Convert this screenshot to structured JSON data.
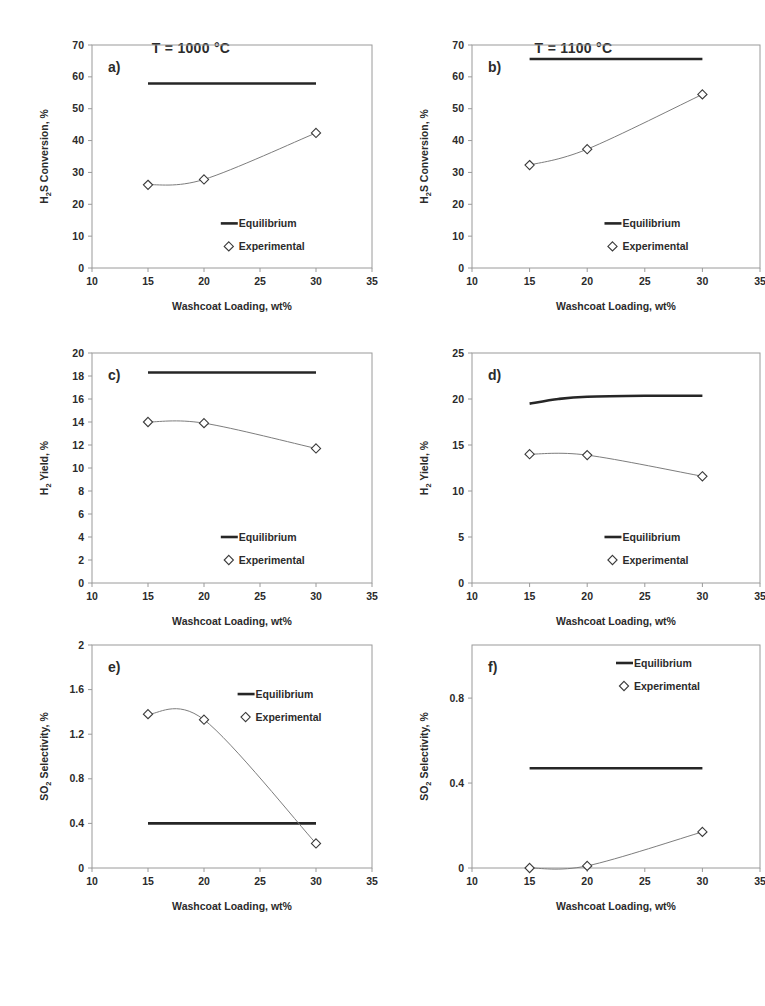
{
  "figure": {
    "column_titles": [
      "T = 1000 °C",
      "T = 1100 °C"
    ],
    "legend": {
      "equilibrium": "Equilibrium",
      "experimental": "Experimental"
    },
    "xlabel": "Washcoat Loading, wt%",
    "colors": {
      "equilibrium_line": "#262626",
      "experimental_line": "#7d7d7d",
      "marker_fill": "#ffffff",
      "marker_stroke": "#3a3a3a",
      "axis": "#9a9a9a",
      "text": "#2b2b2b",
      "background": "#ffffff"
    }
  },
  "chart_data": [
    {
      "id": "a",
      "panel_label": "a)",
      "type": "line",
      "title": "T = 1000 °C",
      "xlabel": "Washcoat Loading, wt%",
      "ylabel": "H₂S Conversion, %",
      "ylabel_parts": {
        "pre": "H",
        "sub": "2",
        "post": "S Conversion, %"
      },
      "xlim": [
        10,
        35
      ],
      "ylim": [
        0,
        70
      ],
      "xticks": [
        10,
        15,
        20,
        25,
        30,
        35
      ],
      "yticks": [
        0,
        10,
        20,
        30,
        40,
        50,
        60,
        70
      ],
      "grid": false,
      "legend_position": "inside-bottom-right",
      "series": [
        {
          "name": "Equilibrium",
          "style": "solid-thick",
          "x": [
            15,
            20,
            25,
            30
          ],
          "values": [
            57.9,
            57.9,
            57.9,
            57.9
          ]
        },
        {
          "name": "Experimental",
          "style": "line-marker-diamond",
          "x": [
            15,
            20,
            30
          ],
          "values": [
            26.1,
            27.8,
            42.4
          ]
        }
      ]
    },
    {
      "id": "b",
      "panel_label": "b)",
      "type": "line",
      "title": "T = 1100 °C",
      "xlabel": "Washcoat Loading, wt%",
      "ylabel": "H₂S Conversion, %",
      "ylabel_parts": {
        "pre": "H",
        "sub": "2",
        "post": "S Conversion, %"
      },
      "xlim": [
        10,
        35
      ],
      "ylim": [
        0,
        70
      ],
      "xticks": [
        10,
        15,
        20,
        25,
        30,
        35
      ],
      "yticks": [
        0,
        10,
        20,
        30,
        40,
        50,
        60,
        70
      ],
      "grid": false,
      "legend_position": "inside-bottom-right",
      "series": [
        {
          "name": "Equilibrium",
          "style": "solid-thick",
          "x": [
            15,
            20,
            25,
            30
          ],
          "values": [
            65.6,
            65.6,
            65.6,
            65.6
          ]
        },
        {
          "name": "Experimental",
          "style": "line-marker-diamond",
          "x": [
            15,
            20,
            30
          ],
          "values": [
            32.3,
            37.3,
            54.5
          ]
        }
      ]
    },
    {
      "id": "c",
      "panel_label": "c)",
      "type": "line",
      "title": "T = 1000 °C",
      "xlabel": "Washcoat Loading, wt%",
      "ylabel": "H₂ Yield, %",
      "ylabel_parts": {
        "pre": "H",
        "sub": "2",
        "post": " Yield, %"
      },
      "xlim": [
        10,
        35
      ],
      "ylim": [
        0,
        20
      ],
      "xticks": [
        10,
        15,
        20,
        25,
        30,
        35
      ],
      "yticks": [
        0,
        2,
        4,
        6,
        8,
        10,
        12,
        14,
        16,
        18,
        20
      ],
      "grid": false,
      "legend_position": "inside-bottom-right",
      "series": [
        {
          "name": "Equilibrium",
          "style": "solid-thick",
          "x": [
            15,
            20,
            25,
            30
          ],
          "values": [
            18.3,
            18.3,
            18.3,
            18.3
          ]
        },
        {
          "name": "Experimental",
          "style": "line-marker-diamond",
          "x": [
            15,
            20,
            30
          ],
          "values": [
            14.0,
            13.9,
            11.7
          ]
        }
      ]
    },
    {
      "id": "d",
      "panel_label": "d)",
      "type": "line",
      "title": "T = 1100 °C",
      "xlabel": "Washcoat Loading, wt%",
      "ylabel": "H₂ Yield, %",
      "ylabel_parts": {
        "pre": "H",
        "sub": "2",
        "post": " Yield, %"
      },
      "xlim": [
        10,
        35
      ],
      "ylim": [
        0,
        25
      ],
      "xticks": [
        10,
        15,
        20,
        25,
        30,
        35
      ],
      "yticks": [
        0,
        5,
        10,
        15,
        20,
        25
      ],
      "grid": false,
      "legend_position": "inside-bottom-right",
      "series": [
        {
          "name": "Equilibrium",
          "style": "solid-thick",
          "x": [
            15,
            17.5,
            20,
            25,
            30
          ],
          "values": [
            19.5,
            20.0,
            20.25,
            20.35,
            20.35
          ]
        },
        {
          "name": "Experimental",
          "style": "line-marker-diamond",
          "x": [
            15,
            20,
            30
          ],
          "values": [
            14.0,
            13.9,
            11.6
          ]
        }
      ]
    },
    {
      "id": "e",
      "panel_label": "e)",
      "type": "line",
      "title": "T = 1000 °C",
      "xlabel": "Washcoat Loading, wt%",
      "ylabel": "SO₂ Selectivity, %",
      "ylabel_parts": {
        "pre": "SO",
        "sub": "2",
        "post": " Selectivity, %"
      },
      "xlim": [
        10,
        35
      ],
      "ylim": [
        0,
        2
      ],
      "xticks": [
        10,
        15,
        20,
        25,
        30,
        35
      ],
      "yticks": [
        0,
        0.4,
        0.8,
        1.2,
        1.6,
        2
      ],
      "ytick_labels": [
        "0",
        "0.4",
        "0.8",
        "1.2",
        "1.6",
        "2"
      ],
      "grid": false,
      "legend_position": "inside-upper-right",
      "series": [
        {
          "name": "Equilibrium",
          "style": "solid-thick",
          "x": [
            15,
            20,
            25,
            30
          ],
          "values": [
            0.4,
            0.4,
            0.4,
            0.4
          ]
        },
        {
          "name": "Experimental",
          "style": "line-marker-diamond",
          "x": [
            15,
            20,
            30
          ],
          "values": [
            1.38,
            1.33,
            0.22
          ]
        }
      ]
    },
    {
      "id": "f",
      "panel_label": "f)",
      "type": "line",
      "title": "T = 1100 °C",
      "xlabel": "Washcoat Loading, wt%",
      "ylabel": "SO₂ Selectivity, %",
      "ylabel_parts": {
        "pre": "SO",
        "sub": "2",
        "post": " Selectivity, %"
      },
      "xlim": [
        10,
        35
      ],
      "ylim": [
        0,
        1.05
      ],
      "xticks": [
        10,
        15,
        20,
        25,
        30,
        35
      ],
      "yticks": [
        0,
        0.4,
        0.8
      ],
      "ytick_labels": [
        "0",
        "0.4",
        "0.8"
      ],
      "grid": false,
      "legend_position": "inside-top-right",
      "series": [
        {
          "name": "Equilibrium",
          "style": "solid-thick",
          "x": [
            15,
            20,
            25,
            30
          ],
          "values": [
            0.47,
            0.47,
            0.47,
            0.47
          ]
        },
        {
          "name": "Experimental",
          "style": "line-marker-diamond",
          "x": [
            15,
            20,
            30
          ],
          "values": [
            0.0,
            0.01,
            0.17
          ]
        }
      ]
    }
  ]
}
